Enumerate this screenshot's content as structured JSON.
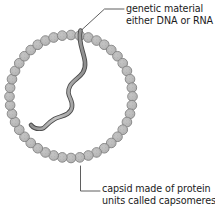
{
  "diagram": {
    "background_color": "#ffffff",
    "labels": {
      "genetic_material": {
        "line1": "genetic material",
        "line2": "either DNA or RNA",
        "icon": "leader-line-icon"
      },
      "capsid": {
        "line1": "capsid made of protein",
        "line2": "units called capsomeres",
        "icon": "leader-line-icon"
      }
    },
    "colors": {
      "capsomere_fill": "#b3b3b3",
      "capsomere_stroke": "#6e6e6e",
      "strand_fill": "#a8a8a8",
      "strand_stroke": "#4d4d4d",
      "leader_line": "#4d4d4d",
      "text": "#1b1b1b"
    },
    "capsid": {
      "center_x": 71,
      "center_y": 96.5,
      "radius": 61.5,
      "capsomere_count": 44,
      "capsomere_radius": 4.8
    },
    "genetic_strand": {
      "path": "M 80.5 30.5 C 77.5 42 84 52 85 62 C 86.5 76 74 78 70 86 C 65 95.5 73.5 99 72 107 C 70.5 116 59.5 116 54.5 119 C 47.5 123 45 128 42.5 128.5 C 37 129.5 33 127.5 31 125",
      "stroke_width": 4.6
    },
    "leaders": {
      "genetic": "M 124 9 L 104.5 9 L 80.5 31",
      "capsid": "M 100 191 L 80.5 191 L 80.5 166"
    }
  }
}
